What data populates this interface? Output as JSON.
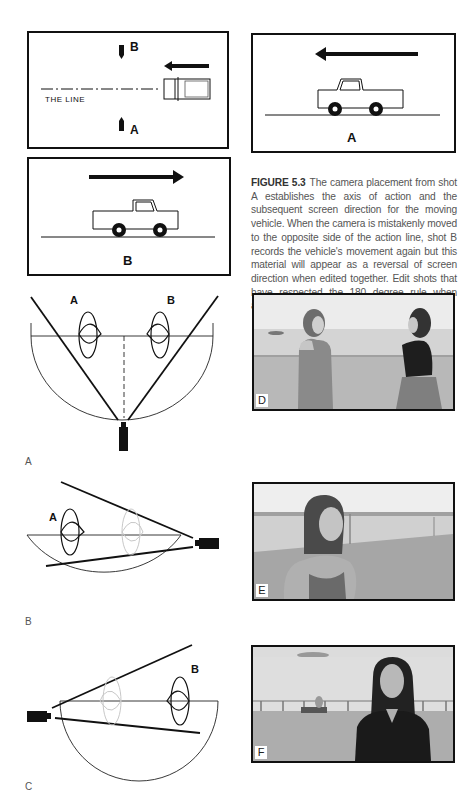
{
  "top_figure": {
    "overhead_diagram": {
      "label_b": "B",
      "label_a": "A",
      "line_label": "THE LINE"
    },
    "shot_a_frame": {
      "label": "A",
      "direction": "left"
    },
    "shot_b_frame": {
      "label": "B",
      "direction": "right"
    },
    "caption": {
      "figure_number": "FIGURE 5.3",
      "text": "The camera placement from shot A establishes the axis of action and the subsequent screen direction for the moving vehicle. When the camera is mistakenly moved to the opposite side of the action line, shot B records the vehicle's movement again but this material will appear as a reversal of screen direction when edited together. Edit shots that have respected the 180 degree rule when assembling coverage for a scene."
    }
  },
  "panels": [
    {
      "panel_label": "A",
      "subject_labels": [
        "A",
        "B"
      ],
      "photo_tag": "D"
    },
    {
      "panel_label": "B",
      "subject_labels": [
        "A"
      ],
      "photo_tag": "E"
    },
    {
      "panel_label": "C",
      "subject_labels": [
        "B"
      ],
      "photo_tag": "F"
    }
  ]
}
